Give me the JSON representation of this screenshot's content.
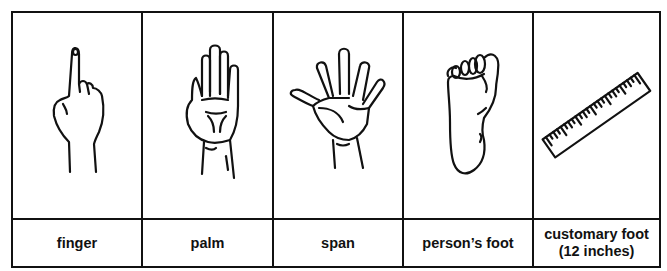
{
  "figure": {
    "columns": [
      {
        "id": "finger",
        "label": "finger",
        "icon": "finger-icon"
      },
      {
        "id": "palm",
        "label": "palm",
        "icon": "palm-icon"
      },
      {
        "id": "span",
        "label": "span",
        "icon": "span-hand-icon"
      },
      {
        "id": "persons-foot",
        "label": "person’s foot",
        "icon": "foot-icon"
      },
      {
        "id": "customary-foot",
        "label": "customary foot\n(12 inches)",
        "icon": "ruler-icon"
      }
    ]
  }
}
